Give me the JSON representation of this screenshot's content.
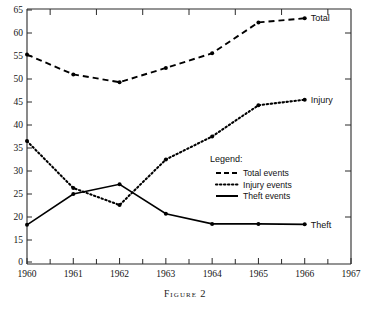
{
  "caption": {
    "word": "Figure",
    "number": "2"
  },
  "chart_data": {
    "type": "line",
    "title": "",
    "xlabel": "",
    "ylabel": "",
    "x": [
      1960,
      1961,
      1962,
      1963,
      1964,
      1965,
      1966
    ],
    "categories": [
      "1960",
      "1961",
      "1962",
      "1963",
      "1964",
      "1965",
      "1966"
    ],
    "xlim": [
      1960,
      1967
    ],
    "ylim": [
      15,
      65
    ],
    "grid": false,
    "y_axis_break": true,
    "xtick_labels": [
      "1960",
      "1961",
      "1962",
      "1963",
      "1964",
      "1965",
      "1966",
      "1967"
    ],
    "xticks": [
      1960,
      1961,
      1962,
      1963,
      1964,
      1965,
      1966,
      1967
    ],
    "x_minor_ticks": [
      1960.5,
      1961.5,
      1962.5,
      1963.5,
      1964.5,
      1965.5,
      1966.5
    ],
    "ytick_labels": [
      "0",
      "15",
      "20",
      "25",
      "30",
      "35",
      "40",
      "45",
      "50",
      "55",
      "60",
      "65"
    ],
    "yticks": [
      0,
      15,
      20,
      25,
      30,
      35,
      40,
      45,
      50,
      55,
      60,
      65
    ],
    "series": [
      {
        "name": "Total events",
        "end_label": "Total",
        "style": "dashed",
        "values": [
          55.3,
          51.0,
          49.3,
          52.4,
          55.6,
          62.3,
          63.2
        ]
      },
      {
        "name": "Injury events",
        "end_label": "Injury",
        "style": "dotted",
        "values": [
          36.5,
          26.3,
          22.6,
          32.5,
          37.5,
          44.3,
          45.5
        ]
      },
      {
        "name": "Theft events",
        "end_label": "Theft",
        "style": "solid",
        "values": [
          18.3,
          25.0,
          27.1,
          20.7,
          18.5,
          18.5,
          18.4
        ]
      }
    ],
    "legend": {
      "title": "Legend:",
      "position": "inside-center-right",
      "entries": [
        {
          "label": "Total events",
          "style": "dashed"
        },
        {
          "label": "Injury events",
          "style": "dotted"
        },
        {
          "label": "Theft events",
          "style": "solid"
        }
      ]
    },
    "annotations": [
      {
        "text": "Total",
        "at_x": 1966,
        "at_y": 63.2
      },
      {
        "text": "Injury",
        "at_x": 1966,
        "at_y": 45.5
      },
      {
        "text": "Theft",
        "at_x": 1966,
        "at_y": 18.4
      }
    ]
  }
}
